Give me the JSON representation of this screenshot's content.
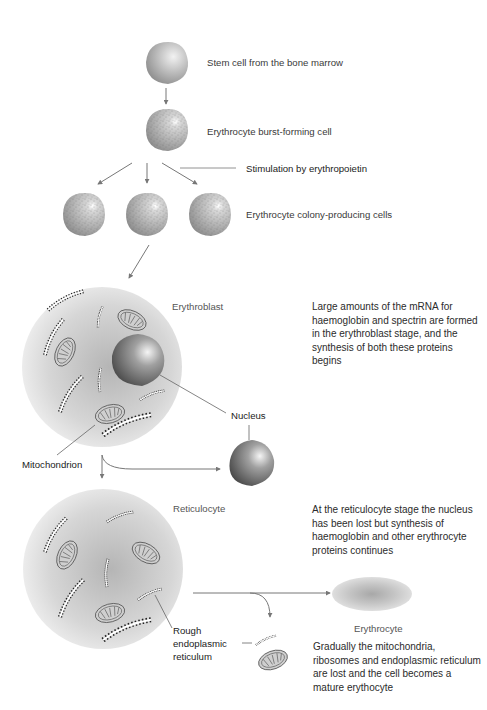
{
  "labels": {
    "stem_cell": "Stem cell from the bone marrow",
    "bfu": "Erythrocyte burst-forming cell",
    "epo": "Stimulation by erythropoietin",
    "cfu": "Erythrocyte colony-producing cells",
    "erythroblast": "Erythroblast",
    "nucleus": "Nucleus",
    "mitochondrion": "Mitochondrion",
    "reticulocyte": "Reticulocyte",
    "rough_er_1": "Rough",
    "rough_er_2": "endoplasmic",
    "rough_er_3": "reticulum",
    "erythrocyte": "Erythrocyte"
  },
  "descriptions": {
    "erythroblast": "Large amounts of the mRNA for haemoglobin and spectrin are formed in the erythroblast stage, and the synthesis of both these proteins begins",
    "reticulocyte": "At the reticulocyte stage the nucleus has been lost but synthesis of haemoglobin and other erythrocyte proteins continues",
    "erythrocyte": "Gradually the mitochondria, ribosomes and endoplasmic reticulum are lost and the cell becomes a mature erythocyte"
  },
  "colors": {
    "arrow": "#777777",
    "cell_fill": "#bdbdbd",
    "nucleus": "#6e6e6e",
    "text": "#333333"
  }
}
